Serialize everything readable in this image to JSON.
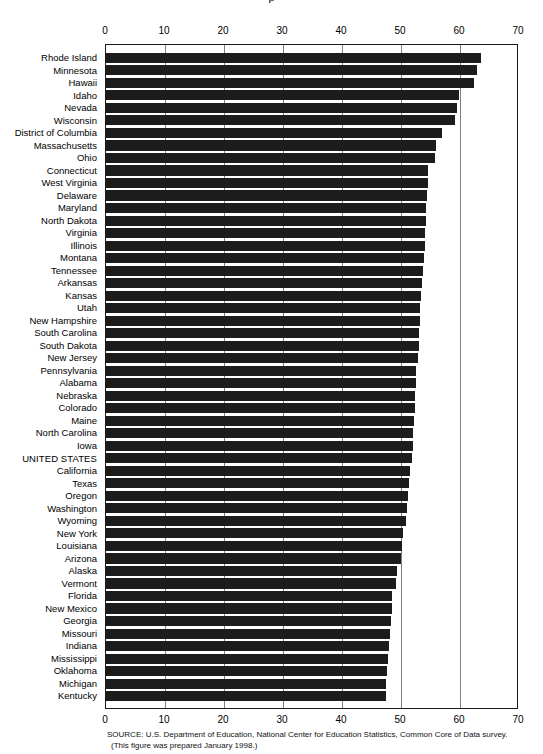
{
  "title_sliver": "p",
  "source": {
    "line1": "SOURCE: U.S. Department of Education, National Center for Education Statistics, Common Core of Data survey.",
    "line2": "(This figure was prepared January 1998.)"
  },
  "chart_data": {
    "type": "bar",
    "orientation": "horizontal",
    "title": "",
    "xlabel": "",
    "ylabel": "",
    "xlim": [
      0,
      70
    ],
    "xticks": [
      0,
      10,
      20,
      30,
      40,
      50,
      60,
      70
    ],
    "grid": true,
    "axis_positions": "top and bottom",
    "legend": "none",
    "bar_color": "#1c1c1c",
    "highlight_category": "UNITED STATES",
    "categories": [
      "Rhode Island",
      "Minnesota",
      "Hawaii",
      "Idaho",
      "Nevada",
      "Wisconsin",
      "District of Columbia",
      "Massachusetts",
      "Ohio",
      "Connecticut",
      "West Virginia",
      "Delaware",
      "Maryland",
      "North Dakota",
      "Virginia",
      "Illinois",
      "Montana",
      "Tennessee",
      "Arkansas",
      "Kansas",
      "Utah",
      "New Hampshire",
      "South Carolina",
      "South Dakota",
      "New Jersey",
      "Pennsylvania",
      "Alabama",
      "Nebraska",
      "Colorado",
      "Maine",
      "North Carolina",
      "Iowa",
      "UNITED STATES",
      "California",
      "Texas",
      "Oregon",
      "Washington",
      "Wyoming",
      "New York",
      "Louisiana",
      "Arizona",
      "Alaska",
      "Vermont",
      "Florida",
      "New Mexico",
      "Georgia",
      "Missouri",
      "Indiana",
      "Mississippi",
      "Oklahoma",
      "Michigan",
      "Kentucky"
    ],
    "values": [
      63.6,
      62.9,
      62.3,
      59.8,
      59.5,
      59.2,
      57.0,
      56.0,
      55.7,
      54.6,
      54.5,
      54.4,
      54.3,
      54.2,
      54.1,
      54.0,
      53.9,
      53.8,
      53.5,
      53.4,
      53.3,
      53.2,
      53.1,
      53.0,
      52.8,
      52.6,
      52.5,
      52.4,
      52.3,
      52.2,
      52.1,
      52.0,
      51.8,
      51.6,
      51.4,
      51.2,
      51.0,
      50.8,
      50.4,
      50.2,
      50.0,
      49.4,
      49.2,
      48.5,
      48.4,
      48.3,
      48.2,
      48.0,
      47.8,
      47.6,
      47.5,
      47.4
    ]
  }
}
